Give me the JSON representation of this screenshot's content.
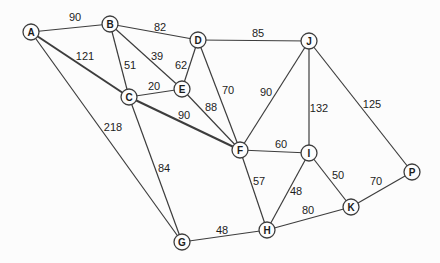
{
  "graph": {
    "type": "undirected-weighted-graph",
    "background_color": "#fcfcfc",
    "line_color": "#3d3d3d",
    "node_fill_color": "#fdfdfd",
    "text_color": "#1c1c1c",
    "node_radius": 8,
    "nodes": [
      {
        "id": "A",
        "x": 31,
        "y": 32
      },
      {
        "id": "B",
        "x": 110,
        "y": 24
      },
      {
        "id": "C",
        "x": 129,
        "y": 97
      },
      {
        "id": "D",
        "x": 198,
        "y": 40
      },
      {
        "id": "E",
        "x": 182,
        "y": 89
      },
      {
        "id": "F",
        "x": 240,
        "y": 150
      },
      {
        "id": "G",
        "x": 182,
        "y": 242
      },
      {
        "id": "H",
        "x": 267,
        "y": 230
      },
      {
        "id": "I",
        "x": 309,
        "y": 153
      },
      {
        "id": "J",
        "x": 309,
        "y": 41
      },
      {
        "id": "K",
        "x": 351,
        "y": 207
      },
      {
        "id": "P",
        "x": 412,
        "y": 172
      }
    ],
    "edges": [
      {
        "from": "A",
        "to": "B",
        "weight": "90",
        "lx": 75,
        "ly": 17
      },
      {
        "from": "B",
        "to": "D",
        "weight": "82",
        "lx": 160,
        "ly": 27
      },
      {
        "from": "D",
        "to": "J",
        "weight": "85",
        "lx": 258,
        "ly": 33
      },
      {
        "from": "A",
        "to": "C",
        "weight": "121",
        "lx": 85,
        "ly": 56,
        "bold": true
      },
      {
        "from": "B",
        "to": "C",
        "weight": "51",
        "lx": 130,
        "ly": 65
      },
      {
        "from": "B",
        "to": "E",
        "weight": "39",
        "lx": 157,
        "ly": 56
      },
      {
        "from": "D",
        "to": "E",
        "weight": "62",
        "lx": 181,
        "ly": 65
      },
      {
        "from": "C",
        "to": "E",
        "weight": "20",
        "lx": 154,
        "ly": 86
      },
      {
        "from": "D",
        "to": "F",
        "weight": "70",
        "lx": 228,
        "ly": 90
      },
      {
        "from": "J",
        "to": "F",
        "weight": "90",
        "lx": 266,
        "ly": 92
      },
      {
        "from": "J",
        "to": "I",
        "weight": "132",
        "lx": 319,
        "ly": 108
      },
      {
        "from": "J",
        "to": "P",
        "weight": "125",
        "lx": 372,
        "ly": 104
      },
      {
        "from": "E",
        "to": "F",
        "weight": "88",
        "lx": 211,
        "ly": 107
      },
      {
        "from": "C",
        "to": "F",
        "weight": "90",
        "lx": 184,
        "ly": 115,
        "bold": true
      },
      {
        "from": "A",
        "to": "G",
        "weight": "218",
        "lx": 113,
        "ly": 127
      },
      {
        "from": "C",
        "to": "G",
        "weight": "84",
        "lx": 164,
        "ly": 168
      },
      {
        "from": "F",
        "to": "I",
        "weight": "60",
        "lx": 281,
        "ly": 144
      },
      {
        "from": "F",
        "to": "H",
        "weight": "57",
        "lx": 259,
        "ly": 181
      },
      {
        "from": "I",
        "to": "H",
        "weight": "48",
        "lx": 296,
        "ly": 191
      },
      {
        "from": "I",
        "to": "K",
        "weight": "50",
        "lx": 338,
        "ly": 175
      },
      {
        "from": "K",
        "to": "P",
        "weight": "70",
        "lx": 376,
        "ly": 181
      },
      {
        "from": "H",
        "to": "K",
        "weight": "80",
        "lx": 308,
        "ly": 210
      },
      {
        "from": "G",
        "to": "H",
        "weight": "48",
        "lx": 222,
        "ly": 230
      }
    ]
  }
}
